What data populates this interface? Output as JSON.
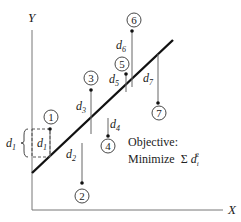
{
  "diagram": {
    "axes": {
      "x_label": "X",
      "y_label": "Y"
    },
    "objective": {
      "line1": "Objective:",
      "line2_prefix": "Minimize",
      "sigma": "Σ",
      "var": "d",
      "subscript": "i",
      "superscript": "2"
    },
    "bracket_label": {
      "var": "d",
      "sub": "1"
    },
    "points": [
      {
        "id": "1",
        "label": "1",
        "dist_var": "d",
        "dist_sub": "1"
      },
      {
        "id": "2",
        "label": "2",
        "dist_var": "d",
        "dist_sub": "2"
      },
      {
        "id": "3",
        "label": "3",
        "dist_var": "d",
        "dist_sub": "3"
      },
      {
        "id": "4",
        "label": "4",
        "dist_var": "d",
        "dist_sub": "4"
      },
      {
        "id": "5",
        "label": "5",
        "dist_var": "d",
        "dist_sub": "5"
      },
      {
        "id": "6",
        "label": "6",
        "dist_var": "d",
        "dist_sub": "6"
      },
      {
        "id": "7",
        "label": "7",
        "dist_var": "d",
        "dist_sub": "7"
      }
    ],
    "colors": {
      "line": "#111111",
      "axis": "#777777",
      "residual": "#666666"
    }
  }
}
